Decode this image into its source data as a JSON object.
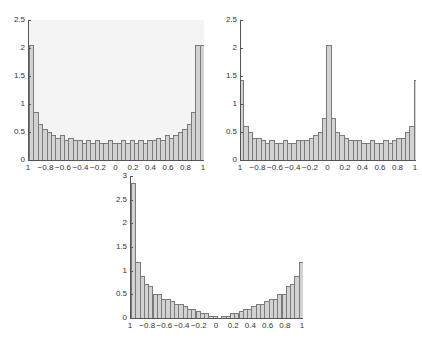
{
  "chart_data": [
    {
      "type": "bar",
      "title": "",
      "xlabel": "",
      "ylabel": "",
      "xlim": [
        -1,
        1
      ],
      "ylim": [
        0,
        2.5
      ],
      "background": "#f4f4f4",
      "yticks": [
        "0",
        "0.5",
        "1",
        "1.5",
        "2",
        "2.5"
      ],
      "ytick_values": [
        0,
        0.5,
        1,
        1.5,
        2,
        2.5
      ],
      "xticks": [
        "1",
        "−0.8",
        "−0.6",
        "−0.4",
        "−0.2",
        "0",
        "0.2",
        "0.4",
        "0.6",
        "0.8",
        "1"
      ],
      "xtick_values": [
        -1,
        -0.8,
        -0.6,
        -0.4,
        -0.2,
        0,
        0.2,
        0.4,
        0.6,
        0.8,
        1
      ],
      "bin_edges_start": -1,
      "bin_width": 0.05,
      "values": [
        2.05,
        0.85,
        0.65,
        0.55,
        0.5,
        0.45,
        0.4,
        0.45,
        0.35,
        0.4,
        0.35,
        0.35,
        0.3,
        0.35,
        0.3,
        0.35,
        0.3,
        0.3,
        0.35,
        0.3,
        0.3,
        0.35,
        0.3,
        0.35,
        0.3,
        0.35,
        0.3,
        0.35,
        0.35,
        0.4,
        0.35,
        0.45,
        0.4,
        0.45,
        0.5,
        0.55,
        0.65,
        0.85,
        2.05,
        2.05
      ]
    },
    {
      "type": "bar",
      "title": "",
      "xlabel": "",
      "ylabel": "",
      "xlim": [
        -1,
        1
      ],
      "ylim": [
        0,
        2.5
      ],
      "background": "#ffffff",
      "yticks": [
        "0",
        "0.5",
        "1",
        "1.5",
        "2",
        "2.5"
      ],
      "ytick_values": [
        0,
        0.5,
        1,
        1.5,
        2,
        2.5
      ],
      "xticks": [
        "1",
        "−0.8",
        "−0.6",
        "−0.4",
        "−0.2",
        "0",
        "0.2",
        "0.4",
        "0.6",
        "0.8",
        "1"
      ],
      "xtick_values": [
        -1,
        -0.8,
        -0.6,
        -0.4,
        -0.2,
        0,
        0.2,
        0.4,
        0.6,
        0.8,
        1
      ],
      "bin_edges_start": -1.025,
      "bin_width": 0.05,
      "values": [
        1.43,
        0.6,
        0.5,
        0.4,
        0.4,
        0.35,
        0.3,
        0.35,
        0.3,
        0.3,
        0.35,
        0.3,
        0.3,
        0.35,
        0.35,
        0.35,
        0.4,
        0.45,
        0.5,
        0.75,
        2.05,
        0.75,
        0.5,
        0.45,
        0.4,
        0.35,
        0.35,
        0.35,
        0.3,
        0.3,
        0.35,
        0.3,
        0.3,
        0.35,
        0.3,
        0.35,
        0.4,
        0.4,
        0.5,
        0.6,
        1.43
      ]
    },
    {
      "type": "bar",
      "title": "",
      "xlabel": "",
      "ylabel": "",
      "xlim": [
        -1,
        1
      ],
      "ylim": [
        0,
        3
      ],
      "background": "#ffffff",
      "yticks": [
        "0",
        "0.5",
        "1",
        "1.5",
        "2",
        "2.5",
        "3"
      ],
      "ytick_values": [
        0,
        0.5,
        1,
        1.5,
        2,
        2.5,
        3
      ],
      "xticks": [
        "1",
        "−0.8",
        "−0.6",
        "−0.4",
        "−0.2",
        "0",
        "0.2",
        "0.4",
        "0.6",
        "0.8",
        "1"
      ],
      "xtick_values": [
        -1,
        -0.8,
        -0.6,
        -0.4,
        -0.2,
        0,
        0.2,
        0.4,
        0.6,
        0.8,
        1
      ],
      "bin_edges_start": -1,
      "bin_width": 0.05,
      "values": [
        2.85,
        1.18,
        0.88,
        0.72,
        0.67,
        0.5,
        0.5,
        0.4,
        0.4,
        0.35,
        0.3,
        0.3,
        0.25,
        0.2,
        0.2,
        0.15,
        0.1,
        0.1,
        0.05,
        0.05,
        0.0,
        0.05,
        0.05,
        0.1,
        0.1,
        0.15,
        0.2,
        0.2,
        0.25,
        0.3,
        0.3,
        0.35,
        0.4,
        0.4,
        0.5,
        0.5,
        0.67,
        0.72,
        0.88,
        1.18,
        2.85
      ]
    }
  ]
}
